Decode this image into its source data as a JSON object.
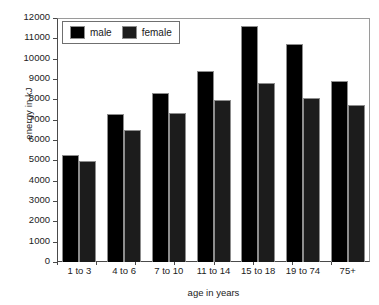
{
  "chart_data": {
    "type": "bar",
    "title": "",
    "subtitle": "",
    "xlabel": "age in years",
    "ylabel": "energy in kJ",
    "categories": [
      "1 to 3",
      "4 to 6",
      "7 to 10",
      "11 to 14",
      "15 to 18",
      "19 to 74",
      "75+"
    ],
    "series": [
      {
        "name": "male",
        "color": "#000000",
        "values": [
          5250,
          7300,
          8300,
          9400,
          11600,
          10700,
          8900
        ]
      },
      {
        "name": "female",
        "color": "#1c1c1c",
        "values": [
          4950,
          6500,
          7350,
          7950,
          8800,
          8050,
          7700
        ]
      }
    ],
    "ylim": [
      0,
      12000
    ],
    "ytick_step": 1000,
    "yticks": [
      0,
      1000,
      2000,
      3000,
      4000,
      5000,
      6000,
      7000,
      8000,
      9000,
      10000,
      11000,
      12000
    ],
    "ytick_labels": [
      "0",
      "1000",
      "2000",
      "3000",
      "4000",
      "5000",
      "6000",
      "7000",
      "8000",
      "9000",
      "10000",
      "11000",
      "12000"
    ],
    "grid": false,
    "legend_position": "top-left-inside",
    "legend_entries": [
      "male",
      "female"
    ],
    "bar_mode": "grouped"
  }
}
